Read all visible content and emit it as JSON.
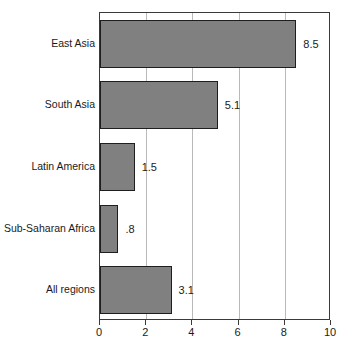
{
  "chart_data": {
    "type": "bar",
    "orientation": "horizontal",
    "title": "",
    "subtitle": "",
    "xlabel": "",
    "ylabel": "",
    "categories": [
      "East Asia",
      "South Asia",
      "Latin America",
      "Sub-Saharan Africa",
      "All regions"
    ],
    "values": [
      8.5,
      5.1,
      1.5,
      0.8,
      3.1
    ],
    "value_labels": [
      "8.5",
      "5.1",
      "1.5",
      ".8",
      "3.1"
    ],
    "xlim": [
      0,
      10
    ],
    "xticks": [
      0,
      2,
      4,
      6,
      8,
      10
    ],
    "xtick_labels": [
      "0",
      "2",
      "4",
      "6",
      "8",
      "10"
    ],
    "gridlines": [
      2,
      4,
      6,
      8
    ],
    "grid": true,
    "legend": null,
    "bar_color": "#808080",
    "bar_border_color": "#1e1e1e",
    "axis_color": "#3a3a3a",
    "grid_color": "#b9b9b9",
    "background": "#ffffff"
  }
}
